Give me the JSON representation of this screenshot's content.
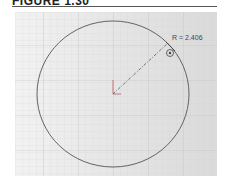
{
  "figure": {
    "title": "FIGURE 1.30"
  },
  "sketch": {
    "entity": "circle",
    "dimension_label": "R = 2.406",
    "radius_value": "2.406",
    "constraint_icon": "coincident-relation-icon",
    "colors": {
      "circle": "#555555",
      "dimension_line": "#555555",
      "grid": "#c8c8c8",
      "background": "#e6e6e6"
    }
  }
}
